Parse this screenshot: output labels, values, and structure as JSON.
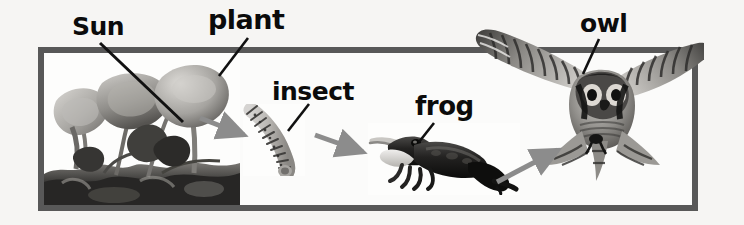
{
  "diagram": {
    "frame_color": "#585858",
    "background_color": "#f6f5f3",
    "arrow_color": "#8c8c8c",
    "label_color": "#0b0b0b",
    "labels": [
      {
        "id": "sun",
        "text": "Sun"
      },
      {
        "id": "plant",
        "text": "plant"
      },
      {
        "id": "insect",
        "text": "insect"
      },
      {
        "id": "frog",
        "text": "frog"
      },
      {
        "id": "owl",
        "text": "owl"
      }
    ],
    "organisms": [
      {
        "id": "plant",
        "label": "plant",
        "media": "photograph"
      },
      {
        "id": "insect",
        "label": "insect",
        "media": "photograph"
      },
      {
        "id": "frog",
        "label": "frog",
        "media": "photograph"
      },
      {
        "id": "owl",
        "label": "owl",
        "media": "photograph"
      }
    ],
    "flow": [
      {
        "from": "plant",
        "to": "insect"
      },
      {
        "from": "insect",
        "to": "frog"
      },
      {
        "from": "frog",
        "to": "owl"
      }
    ]
  }
}
